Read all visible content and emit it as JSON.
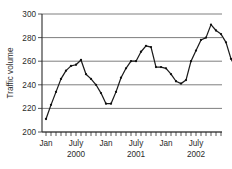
{
  "chart_data": {
    "type": "line",
    "title": "",
    "xlabel": "",
    "ylabel": "Traffic volume",
    "ylim": [
      200,
      300
    ],
    "ytick_labels": [
      "200",
      "220",
      "240",
      "260",
      "280",
      "300"
    ],
    "ytick_values": [
      200,
      220,
      240,
      260,
      280,
      300
    ],
    "grid": true,
    "legend": "none",
    "xtick_group_labels": [
      "Jan",
      "July",
      "Jan",
      "July",
      "Jan",
      "July"
    ],
    "xtick_year_labels": [
      "2000",
      "2001",
      "2002"
    ],
    "x_minor_ticks": 36,
    "x": [
      "Jan 2000",
      "Feb 2000",
      "Mar 2000",
      "Apr 2000",
      "May 2000",
      "Jun 2000",
      "Jul 2000",
      "Aug 2000",
      "Sep 2000",
      "Oct 2000",
      "Nov 2000",
      "Dec 2000",
      "Jan 2001",
      "Feb 2001",
      "Mar 2001",
      "Apr 2001",
      "May 2001",
      "Jun 2001",
      "Jul 2001",
      "Aug 2001",
      "Sep 2001",
      "Oct 2001",
      "Nov 2001",
      "Dec 2001",
      "Jan 2002",
      "Feb 2002",
      "Mar 2002",
      "Apr 2002",
      "May 2002",
      "Jun 2002",
      "Jul 2002",
      "Aug 2002",
      "Sep 2002",
      "Oct 2002",
      "Nov 2002",
      "Dec 2002"
    ],
    "values": [
      211,
      223,
      234,
      245,
      252,
      256,
      257,
      261,
      249,
      245,
      240,
      233,
      224,
      224,
      234,
      246,
      254,
      260,
      260,
      268,
      273,
      272,
      255,
      255,
      254,
      249,
      243,
      241,
      244,
      260,
      269,
      278,
      280,
      291,
      286,
      283
    ],
    "values_tail": [
      276,
      262,
      254
    ],
    "series_name": "Traffic volume"
  }
}
